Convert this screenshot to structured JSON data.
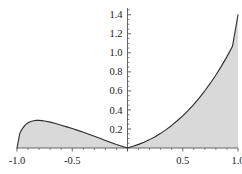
{
  "chart_data": {
    "type": "area",
    "title": "",
    "subtitle": "",
    "xlabel": "",
    "ylabel": "",
    "xlim": [
      -1.0,
      1.0
    ],
    "ylim": [
      0.0,
      1.45
    ],
    "grid": false,
    "legend": null,
    "fill_color": "#d9d9d9",
    "line_color": "#2b2b2b",
    "axis_color": "#555555",
    "background_color": "#ffffff",
    "x_ticks": [
      {
        "value": -1.0,
        "label": "-1.0"
      },
      {
        "value": -0.5,
        "label": "-0.5"
      },
      {
        "value": 0.0,
        "label": ""
      },
      {
        "value": 0.5,
        "label": "0.5"
      },
      {
        "value": 1.0,
        "label": "1.0"
      }
    ],
    "y_ticks": [
      {
        "value": 0.2,
        "label": "0.2"
      },
      {
        "value": 0.4,
        "label": "0.4"
      },
      {
        "value": 0.6,
        "label": "0.6"
      },
      {
        "value": 0.8,
        "label": "0.8"
      },
      {
        "value": 1.0,
        "label": "1.0"
      },
      {
        "value": 1.2,
        "label": "1.2"
      },
      {
        "value": 1.4,
        "label": "1.4"
      }
    ],
    "x_minor_tick_step": 0.1,
    "y_minor_tick_step": 0.05,
    "series": [
      {
        "name": "curve",
        "filled_to_zero": true,
        "x": [
          -1.0,
          -0.975,
          -0.95,
          -0.925,
          -0.9,
          -0.875,
          -0.85,
          -0.825,
          -0.8,
          -0.775,
          -0.75,
          -0.7,
          -0.65,
          -0.6,
          -0.55,
          -0.5,
          -0.45,
          -0.4,
          -0.35,
          -0.3,
          -0.25,
          -0.2,
          -0.15,
          -0.1,
          -0.05,
          0.0,
          0.05,
          0.1,
          0.15,
          0.2,
          0.25,
          0.3,
          0.35,
          0.4,
          0.45,
          0.5,
          0.55,
          0.6,
          0.65,
          0.7,
          0.75,
          0.8,
          0.85,
          0.9,
          0.95,
          1.0
        ],
        "y": [
          0.0,
          0.152,
          0.207,
          0.243,
          0.265,
          0.279,
          0.287,
          0.29,
          0.29,
          0.288,
          0.284,
          0.272,
          0.257,
          0.24,
          0.222,
          0.204,
          0.185,
          0.165,
          0.145,
          0.124,
          0.102,
          0.08,
          0.058,
          0.037,
          0.018,
          0.0,
          0.018,
          0.038,
          0.061,
          0.088,
          0.119,
          0.154,
          0.193,
          0.237,
          0.286,
          0.338,
          0.396,
          0.459,
          0.527,
          0.601,
          0.681,
          0.767,
          0.86,
          0.96,
          1.068,
          1.4
        ]
      }
    ],
    "annotations": []
  }
}
